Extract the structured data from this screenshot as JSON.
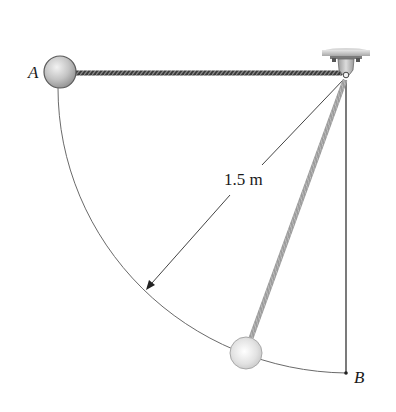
{
  "diagram": {
    "type": "pendulum-mechanics-figure",
    "labels": {
      "point_a": "A",
      "point_b": "B",
      "length": "1.5 m"
    },
    "elements": {
      "pivot": {
        "x": 346,
        "y": 75
      },
      "ball_a": {
        "cx": 60,
        "cy": 72,
        "r": 16
      },
      "ball_lower": {
        "cx": 246,
        "cy": 353,
        "r": 16
      },
      "point_b": {
        "x": 346,
        "y": 373
      },
      "radius_px": 292
    },
    "colors": {
      "ball_fill": "#c8c8c8",
      "ball_stroke": "#6e6e6e",
      "rod": "#4a4a4a",
      "line": "#555555",
      "text": "#1a1a1a",
      "support": "#bdbdbd"
    }
  }
}
